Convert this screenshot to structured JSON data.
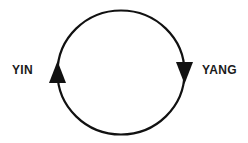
{
  "diagram": {
    "type": "cycle-diagram",
    "background_color": "#ffffff",
    "stroke_color": "#111111",
    "text_color": "#1a1a1a",
    "circle": {
      "center_x": 121,
      "center_y": 72,
      "radius_x": 64,
      "radius_y": 62,
      "stroke_width": 2.2
    },
    "labels": {
      "left": "YIN",
      "right": "YANG"
    },
    "arrows": [
      {
        "name": "left-arrow-up",
        "direction": "up",
        "tip_x": 58,
        "tip_y": 62,
        "base_y": 82,
        "half_width": 8
      },
      {
        "name": "right-arrow-down",
        "direction": "down",
        "tip_x": 184,
        "tip_y": 82,
        "base_y": 62,
        "half_width": 8
      }
    ]
  }
}
